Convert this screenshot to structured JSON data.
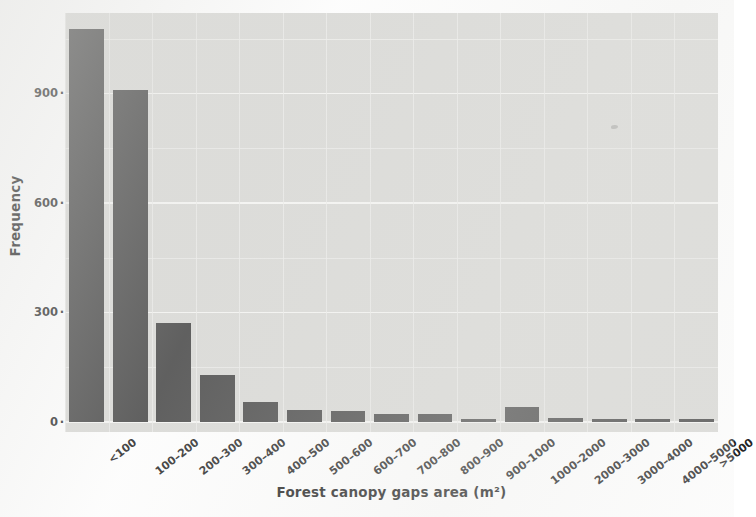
{
  "chart_data": {
    "type": "bar",
    "title": "",
    "xlabel": "Forest canopy gaps area (m²)",
    "ylabel": "Frequency",
    "categories": [
      "<100",
      "100–200",
      "200–300",
      "300–400",
      "400–500",
      "500–600",
      "600–700",
      "700–800",
      "800–900",
      "900–1000",
      "1000–2000",
      "2000–3000",
      "3000–4000",
      "4000–5000",
      ">5000"
    ],
    "values": [
      1076,
      908,
      272,
      130,
      55,
      33,
      30,
      22,
      22,
      9,
      40,
      12,
      5,
      7,
      6
    ],
    "ylim": [
      0,
      1120
    ],
    "yticks": [
      0,
      300,
      600,
      900
    ],
    "ytick_labels": [
      "0",
      "300",
      "600",
      "900"
    ],
    "grid": true,
    "grid_minor": true,
    "legend": "none",
    "bar_color": "#454545",
    "panel_color": "#d7d7d4",
    "gridline_color": "#f4f4f2"
  }
}
